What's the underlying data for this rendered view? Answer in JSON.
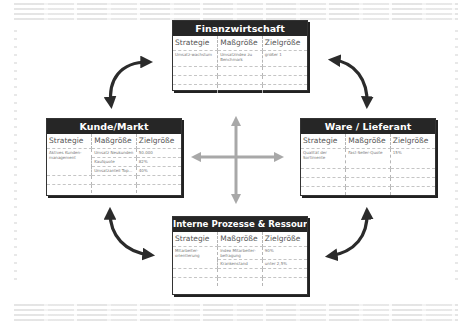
{
  "diagram": {
    "type": "balanced-scorecard",
    "column_headers": [
      "Strategie",
      "Maßgröße",
      "Zielgröße"
    ],
    "perspectives": [
      {
        "id": "finanz",
        "title": "Finanzwirtschaft",
        "rows": [
          {
            "strategie": "Umsatz-wachstum",
            "massgroesse": "Umsatzindex zu Benchmark",
            "zielgroesse": "größer 1"
          }
        ]
      },
      {
        "id": "kunde",
        "title": "Kunde/Markt",
        "rows": [
          {
            "strategie": "Aktives Kunden-management",
            "massgroesse": "Umsatz Neukunden",
            "zielgroesse": "50.000"
          },
          {
            "strategie": "",
            "massgroesse": "Kaufquote",
            "zielgroesse": "82%"
          },
          {
            "strategie": "",
            "massgroesse": "Umsatzanteil Top...",
            "zielgroesse": "40%"
          }
        ]
      },
      {
        "id": "ware",
        "title": "Ware / Lieferant",
        "rows": [
          {
            "strategie": "Qualität der Sortimente",
            "massgroesse": "Fast-Seller-Quote",
            "zielgroesse": "15%"
          }
        ]
      },
      {
        "id": "intern",
        "title": "Interne Prozesse & Ressourcen",
        "rows": [
          {
            "strategie": "Mitarbeiter-orientierung",
            "massgroesse": "Index Mitarbeiter-befragung",
            "zielgroesse": "90%"
          },
          {
            "strategie": "",
            "massgroesse": "Krankenstand",
            "zielgroesse": "unter 2,5%"
          }
        ]
      }
    ],
    "connectors": [
      {
        "from": "kunde",
        "to": "finanz",
        "style": "curved-double-arrow",
        "color": "#2b2b2b"
      },
      {
        "from": "finanz",
        "to": "ware",
        "style": "curved-double-arrow",
        "color": "#2b2b2b"
      },
      {
        "from": "ware",
        "to": "intern",
        "style": "curved-double-arrow",
        "color": "#2b2b2b"
      },
      {
        "from": "intern",
        "to": "kunde",
        "style": "curved-double-arrow",
        "color": "#2b2b2b"
      }
    ],
    "center_cross": {
      "style": "four-way-arrow",
      "color": "#a8a8a8"
    },
    "colors": {
      "header_bg": "#262626",
      "header_text": "#ffffff",
      "border": "#333333",
      "cell_text": "#777777"
    }
  }
}
